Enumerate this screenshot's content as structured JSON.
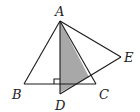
{
  "diagram": {
    "type": "geometry",
    "points": {
      "A": {
        "label": "A",
        "x": 60,
        "y": 21
      },
      "B": {
        "label": "B",
        "x": 24,
        "y": 84
      },
      "C": {
        "label": "C",
        "x": 96,
        "y": 84
      },
      "D": {
        "label": "D",
        "x": 60,
        "y": 94
      },
      "E": {
        "label": "E",
        "x": 121,
        "y": 57
      }
    },
    "segments": [
      "AB",
      "BC",
      "CA",
      "AD",
      "AE",
      "DE"
    ],
    "right_angle_at": "intersection of AD and BC",
    "shaded_region": "bounded by AD, DE and AC",
    "colors": {
      "line": "#1a1a1a",
      "shade": "#a8a8a8",
      "background": "#ffffff"
    }
  }
}
